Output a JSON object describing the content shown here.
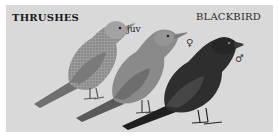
{
  "plate": {
    "title_left": "THRUSHES",
    "title_right": "BLACKBIRD",
    "labels": {
      "juvenile": "juv",
      "female": "♀",
      "male": "♂"
    },
    "background_color": "#d9d9d9",
    "birds": [
      {
        "name": "juvenile-blackbird",
        "tone": "#9a9a9a"
      },
      {
        "name": "female-blackbird",
        "tone": "#7d7d7d"
      },
      {
        "name": "male-blackbird",
        "tone": "#2e2e2e"
      }
    ]
  }
}
